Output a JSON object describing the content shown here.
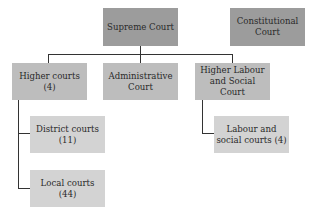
{
  "diagram": {
    "nodes": {
      "supreme": {
        "label": "Supreme Court"
      },
      "constitutional": {
        "label": "Constitutional Court"
      },
      "higher": {
        "label": "Higher courts (4)"
      },
      "administrative": {
        "label": "Administrative Court"
      },
      "labour_higher": {
        "label": "Higher Labour and Social Court"
      },
      "district": {
        "label": "District courts (11)"
      },
      "local": {
        "label": "Local courts (44)"
      },
      "labour": {
        "label": "Labour and social courts (4)"
      }
    },
    "edges": [
      [
        "supreme",
        "higher"
      ],
      [
        "supreme",
        "administrative"
      ],
      [
        "supreme",
        "labour_higher"
      ],
      [
        "higher",
        "district"
      ],
      [
        "higher",
        "local"
      ],
      [
        "labour_higher",
        "labour"
      ]
    ],
    "colors": {
      "top": "#9c9c9c",
      "second": "#bdbdbd",
      "third": "#d3d3d3",
      "line": "#333333"
    }
  }
}
